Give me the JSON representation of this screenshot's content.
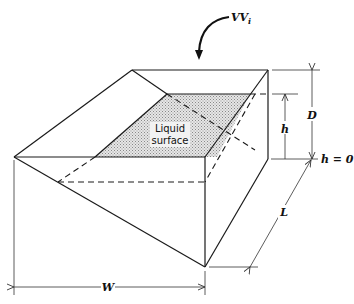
{
  "figure": {
    "labels": {
      "inflow": "VV",
      "inflow_sub": "i",
      "liquid_line1": "Liquid",
      "liquid_line2": "surface",
      "height": "h",
      "depth": "D",
      "datum": "h = 0",
      "length": "L",
      "width": "W"
    },
    "colors": {
      "line": "#1a1a1a",
      "liquid_fill": "#c8c8c8"
    }
  }
}
